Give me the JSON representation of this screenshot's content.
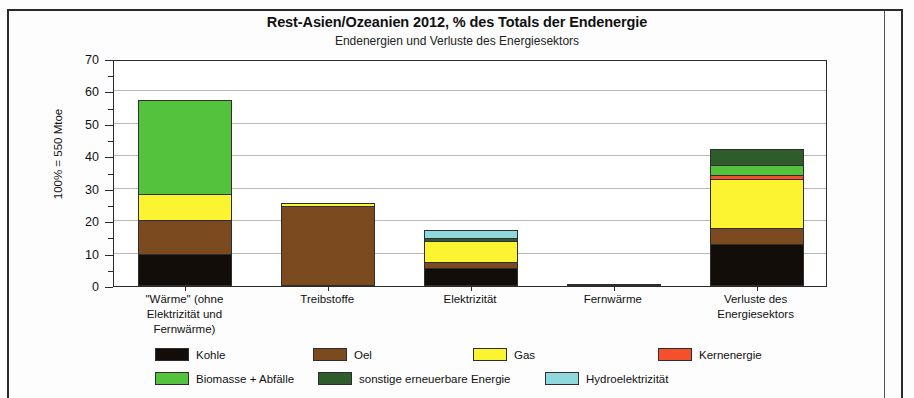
{
  "chart_data": {
    "type": "bar",
    "stacked": true,
    "title": "Rest-Asien/Ozeanien  2012,  % des Totals der Endenergie",
    "subtitle": "Endenergien und Verluste des Energiesektors",
    "ylabel": "100% = 550 Mtoe",
    "xlabel": "",
    "ylim": [
      0,
      70
    ],
    "yticks": [
      0,
      10,
      20,
      30,
      40,
      50,
      60,
      70
    ],
    "yminorticks": [
      5,
      15,
      25,
      35,
      45,
      55,
      65
    ],
    "grid": "horizontal",
    "legend_position": "bottom",
    "categories": [
      "\"Wärme\" (ohne Elektrizität und Fernwärme)",
      "Treibstoffe",
      "Elektrizität",
      "Fernwärme",
      "Verluste des Energiesektors"
    ],
    "category_lines": [
      [
        "\"Wärme\" (ohne",
        "Elektrizität und",
        "Fernwärme)"
      ],
      [
        "Treibstoffe"
      ],
      [
        "Elektrizität"
      ],
      [
        "Fernwärme"
      ],
      [
        "Verluste des",
        "Energiesektors"
      ]
    ],
    "series": [
      {
        "name": "Kohle",
        "color": "#120d08",
        "values": [
          9.8,
          0,
          5.5,
          0,
          13.0
        ]
      },
      {
        "name": "Oel",
        "color": "#7b4a1e",
        "values": [
          10.5,
          24.8,
          1.8,
          0.3,
          5.0
        ]
      },
      {
        "name": "Gas",
        "color": "#fcf430",
        "values": [
          8.2,
          0.6,
          6.7,
          0,
          15.0
        ]
      },
      {
        "name": "Kernenergie",
        "color": "#f4502c",
        "values": [
          0,
          0,
          0,
          0,
          1.3
        ]
      },
      {
        "name": "Biomasse + Abfälle",
        "color": "#54c23c",
        "values": [
          29.0,
          0,
          0,
          0,
          3.0
        ]
      },
      {
        "name": "sonstige erneuerbare Energie",
        "color": "#2e5c2a",
        "values": [
          0,
          0,
          0.9,
          0,
          5.0
        ]
      },
      {
        "name": "Hydroelektrizität",
        "color": "#8ed8de",
        "values": [
          0,
          0,
          2.4,
          0,
          0
        ]
      }
    ],
    "totals": [
      57.5,
      25.4,
      17.3,
      0.3,
      42.3
    ]
  },
  "legend": {
    "rows": [
      [
        {
          "label": "Kohle",
          "color": "#120d08"
        },
        {
          "label": "Oel",
          "color": "#7b4a1e"
        },
        {
          "label": "Gas",
          "color": "#fcf430"
        },
        {
          "label": "Kernenergie",
          "color": "#f4502c"
        }
      ],
      [
        {
          "label": "Biomasse + Abfälle",
          "color": "#54c23c"
        },
        {
          "label": "sonstige erneuerbare Energie",
          "color": "#2e5c2a"
        },
        {
          "label": "Hydroelektrizität",
          "color": "#8ed8de"
        }
      ]
    ]
  }
}
